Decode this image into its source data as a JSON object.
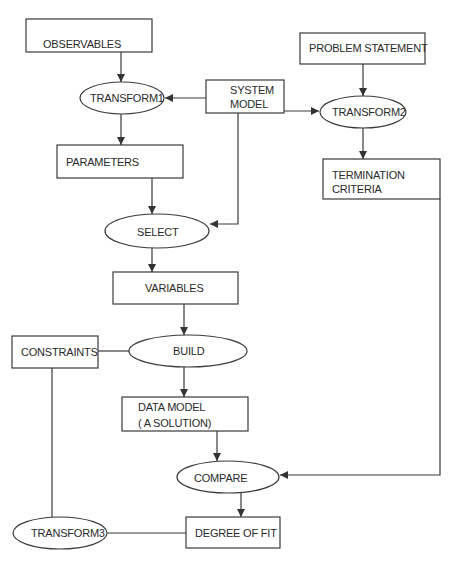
{
  "diagram": {
    "type": "flowchart",
    "stroke_color": "#3a3a3a",
    "text_color": "#2a2a2a",
    "nodes": {
      "observables": {
        "shape": "rectangle",
        "label": "OBSERVABLES"
      },
      "transform1": {
        "shape": "ellipse",
        "label": "TRANSFORM1"
      },
      "system_model": {
        "shape": "rectangle",
        "line1": "SYSTEM",
        "line2": "MODEL"
      },
      "problem_statement": {
        "shape": "rectangle",
        "label": "PROBLEM STATEMENT"
      },
      "transform2": {
        "shape": "ellipse",
        "label": "TRANSFORM2"
      },
      "parameters": {
        "shape": "rectangle",
        "label": "PARAMETERS"
      },
      "termination_criteria": {
        "shape": "rectangle",
        "line1": "TERMINATION",
        "line2": "CRITERIA"
      },
      "select": {
        "shape": "ellipse",
        "label": "SELECT"
      },
      "variables": {
        "shape": "rectangle",
        "label": "VARIABLES"
      },
      "constraints": {
        "shape": "rectangle",
        "label": "CONSTRAINTS"
      },
      "build": {
        "shape": "ellipse",
        "label": "BUILD"
      },
      "data_model": {
        "shape": "rectangle",
        "line1": "DATA MODEL",
        "line2": "( A SOLUTION)"
      },
      "compare": {
        "shape": "ellipse",
        "label": "COMPARE"
      },
      "transform3": {
        "shape": "ellipse",
        "label": "TRANSFORM3"
      },
      "degree_of_fit": {
        "shape": "rectangle",
        "label": "DEGREE OF FIT"
      }
    },
    "edges": [
      {
        "from": "OBSERVABLES",
        "to": "TRANSFORM1",
        "arrow": true
      },
      {
        "from": "SYSTEM MODEL",
        "to": "TRANSFORM1",
        "arrow": true
      },
      {
        "from": "SYSTEM MODEL",
        "to": "TRANSFORM2",
        "arrow": true
      },
      {
        "from": "SYSTEM MODEL",
        "to": "SELECT",
        "arrow": true
      },
      {
        "from": "PROBLEM STATEMENT",
        "to": "TRANSFORM2",
        "arrow": true
      },
      {
        "from": "TRANSFORM1",
        "to": "PARAMETERS",
        "arrow": true
      },
      {
        "from": "TRANSFORM2",
        "to": "TERMINATION CRITERIA",
        "arrow": true
      },
      {
        "from": "PARAMETERS",
        "to": "SELECT",
        "arrow": true
      },
      {
        "from": "SELECT",
        "to": "VARIABLES",
        "arrow": true
      },
      {
        "from": "VARIABLES",
        "to": "BUILD",
        "arrow": true
      },
      {
        "from": "CONSTRAINTS",
        "to": "BUILD",
        "arrow": false
      },
      {
        "from": "BUILD",
        "to": "DATA MODEL",
        "arrow": true
      },
      {
        "from": "DATA MODEL",
        "to": "COMPARE",
        "arrow": true
      },
      {
        "from": "TERMINATION CRITERIA",
        "to": "COMPARE",
        "arrow": true
      },
      {
        "from": "COMPARE",
        "to": "DEGREE OF FIT",
        "arrow": true
      },
      {
        "from": "DEGREE OF FIT",
        "to": "TRANSFORM3",
        "arrow": false
      },
      {
        "from": "TRANSFORM3",
        "to": "CONSTRAINTS",
        "arrow": false
      }
    ]
  }
}
